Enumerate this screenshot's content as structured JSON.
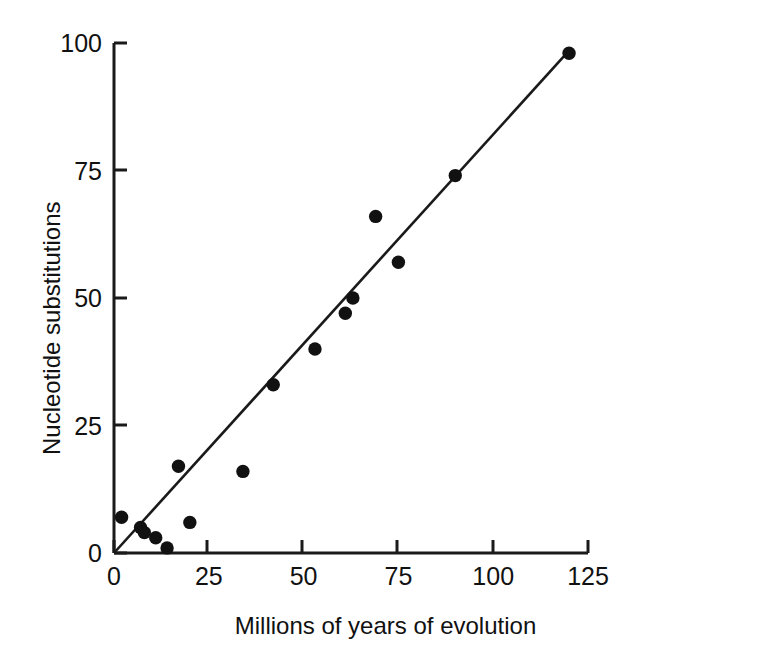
{
  "chart_data": {
    "type": "scatter",
    "title": "",
    "xlabel": "Millions of years of evolution",
    "ylabel": "Nucleotide substitutions",
    "xlim": [
      0,
      125
    ],
    "ylim": [
      0,
      100
    ],
    "xticks": [
      0,
      25,
      50,
      75,
      100,
      125
    ],
    "yticks": [
      0,
      25,
      50,
      75,
      100
    ],
    "xtick_labels": [
      "0",
      "25",
      "50",
      "75",
      "100",
      "125"
    ],
    "ytick_labels": [
      "0",
      "25",
      "50",
      "75",
      "100"
    ],
    "grid": false,
    "legend": null,
    "marker": "filled-circle",
    "marker_color": "#111111",
    "series": [
      {
        "name": "Nucleotide substitutions",
        "points": [
          {
            "x": 2,
            "y": 7
          },
          {
            "x": 7,
            "y": 5
          },
          {
            "x": 8,
            "y": 4
          },
          {
            "x": 11,
            "y": 3
          },
          {
            "x": 14,
            "y": 1
          },
          {
            "x": 17,
            "y": 17
          },
          {
            "x": 20,
            "y": 6
          },
          {
            "x": 34,
            "y": 16
          },
          {
            "x": 42,
            "y": 33
          },
          {
            "x": 53,
            "y": 40
          },
          {
            "x": 61,
            "y": 47
          },
          {
            "x": 63,
            "y": 50
          },
          {
            "x": 69,
            "y": 66
          },
          {
            "x": 75,
            "y": 57
          },
          {
            "x": 90,
            "y": 74
          },
          {
            "x": 120,
            "y": 98
          }
        ]
      }
    ],
    "trendline": {
      "type": "linear",
      "from": {
        "x": 0,
        "y": 0
      },
      "to": {
        "x": 120,
        "y": 98.5
      },
      "slope": 0.82,
      "intercept": 0,
      "color": "#1a1a1a"
    }
  },
  "axis": {
    "x_title": "Millions of years of evolution",
    "y_title": "Nucleotide substitutions",
    "line_color": "#1a1a1a"
  }
}
